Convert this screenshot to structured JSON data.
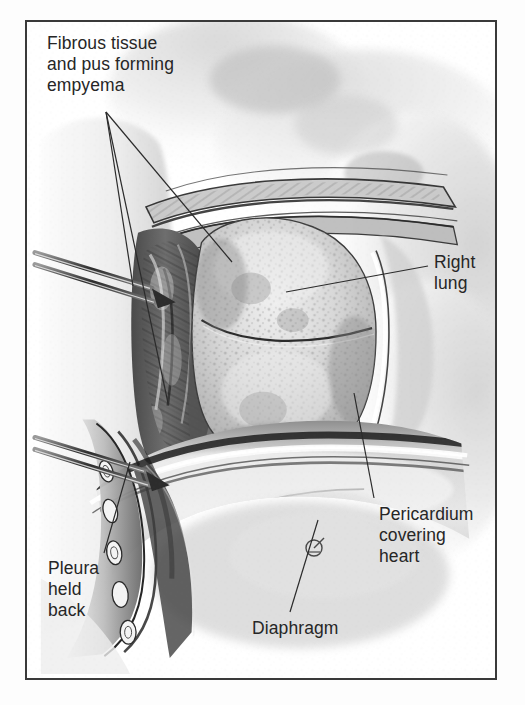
{
  "figure": {
    "type": "medical-illustration",
    "title_visible": false,
    "style": "grayscale pen-and-wash anatomical drawing",
    "frame_color": "#3a3a3a",
    "background_color": "#ffffff",
    "text_color": "#262626"
  },
  "labels": {
    "empyema": {
      "text": "Fibrous tissue\nand pus forming\nempyema",
      "lines": [
        "Fibrous tissue",
        "and pus forming",
        "empyema"
      ],
      "position": "top-left"
    },
    "right_lung": {
      "text": "Right\nlung",
      "lines": [
        "Right",
        "lung"
      ],
      "position": "right"
    },
    "pericardium": {
      "text": "Pericardium\ncovering\nheart",
      "lines": [
        "Pericardium",
        "covering",
        "heart"
      ],
      "position": "bottom-right"
    },
    "pleura": {
      "text": "Pleura\nheld\nback",
      "lines": [
        "Pleura",
        "held",
        "back"
      ],
      "position": "bottom-left"
    },
    "diaphragm": {
      "text": "Diaphragm",
      "lines": [
        "Diaphragm"
      ],
      "position": "bottom-center"
    }
  },
  "leader_lines": [
    {
      "from_label": "empyema",
      "x1": 106,
      "y1": 112,
      "x2": 133,
      "y2": 286
    },
    {
      "from_label": "empyema",
      "x1": 106,
      "y1": 112,
      "x2": 168,
      "y2": 403
    },
    {
      "from_label": "empyema",
      "x1": 106,
      "y1": 112,
      "x2": 232,
      "y2": 262
    },
    {
      "from_label": "right_lung",
      "x1": 428,
      "y1": 266,
      "x2": 286,
      "y2": 292
    },
    {
      "from_label": "pericardium",
      "x1": 374,
      "y1": 498,
      "x2": 354,
      "y2": 393
    },
    {
      "from_label": "pleura",
      "x1": 104,
      "y1": 553,
      "x2": 130,
      "y2": 462
    },
    {
      "from_label": "diaphragm",
      "x1": 290,
      "y1": 612,
      "x2": 318,
      "y2": 520
    }
  ],
  "anatomy": {
    "structures": [
      "chest wall",
      "ribs",
      "parietal pleura reflected back",
      "fibrous tissue and pus (empyema)",
      "right lung with oblique fissure",
      "diaphragm",
      "pericardium covering heart",
      "surgical retractors"
    ],
    "retractor_count": 2,
    "cut_rib_ends_visible": true
  },
  "signature": {
    "present": true,
    "description": "artist monogram",
    "x": 312,
    "y": 546
  }
}
